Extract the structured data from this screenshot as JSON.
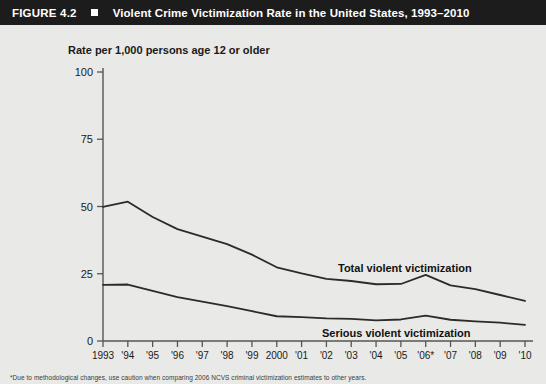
{
  "header": {
    "figure_number": "FIGURE 4.2",
    "bullet_icon": "square-bullet-icon",
    "title": "Violent Crime Victimization Rate in the United States, 1993–2010",
    "bar_color": "#1c1c1c",
    "text_color": "#ffffff"
  },
  "page": {
    "background_color": "#e9e9e7",
    "line_color": "#2b2b2b",
    "axis_color": "#555555"
  },
  "footnote": "*Due to methodological changes, use caution when comparing 2006 NCVS criminal victimization estimates to other years.",
  "chart_data": {
    "type": "line",
    "title": "Violent Crime Victimization Rate in the United States, 1993–2010",
    "ylabel": "Rate per 1,000 persons age 12 or older",
    "xlabel": "",
    "ylim": [
      0,
      100
    ],
    "yticks": [
      0,
      25,
      50,
      75,
      100
    ],
    "ytick_labels": [
      "0",
      "25",
      "50",
      "75",
      "100"
    ],
    "grid": false,
    "legend_position": "inline-annotation",
    "x": [
      1993,
      1994,
      1995,
      1996,
      1997,
      1998,
      1999,
      2000,
      2001,
      2002,
      2003,
      2004,
      2005,
      2006,
      2007,
      2008,
      2009,
      2010
    ],
    "xtick_labels": [
      "1993",
      "'94",
      "'95",
      "'96",
      "'97",
      "'98",
      "'99",
      "2000",
      "'01",
      "'02",
      "'03",
      "'04",
      "'05",
      "'06*",
      "'07",
      "'08",
      "'09",
      "'10"
    ],
    "series": [
      {
        "name": "Total violent victimization",
        "label": "Total violent victimization",
        "values": [
          49.9,
          51.8,
          46.1,
          41.6,
          38.8,
          36.0,
          32.1,
          27.4,
          25.1,
          23.1,
          22.3,
          21.1,
          21.2,
          24.6,
          20.7,
          19.3,
          17.1,
          14.9
        ]
      },
      {
        "name": "Serious violent victimization",
        "label": "Serious violent victimization",
        "values": [
          20.9,
          21.0,
          18.6,
          16.3,
          14.6,
          13.0,
          11.1,
          9.2,
          8.9,
          8.4,
          8.2,
          7.7,
          8.0,
          9.4,
          7.9,
          7.3,
          6.8,
          6.0
        ]
      }
    ]
  }
}
